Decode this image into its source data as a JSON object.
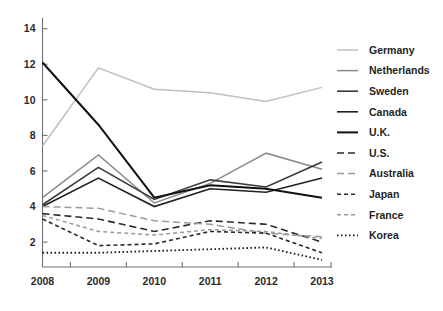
{
  "chart_data": {
    "type": "line",
    "title": "",
    "subtitle": "",
    "xlabel": "",
    "ylabel": "",
    "x": [
      "2008",
      "2009",
      "2010",
      "2011",
      "2012",
      "2013"
    ],
    "categories": [
      "2008",
      "2009",
      "2010",
      "2011",
      "2012",
      "2013"
    ],
    "xtick_labels": [
      "2008",
      "2009",
      "2010",
      "2011",
      "2012",
      "2013"
    ],
    "ytick_labels": [
      "2",
      "4",
      "6",
      "8",
      "10",
      "12",
      "14"
    ],
    "ytick_values": [
      2,
      4,
      6,
      8,
      10,
      12,
      14
    ],
    "ylim": [
      0.6,
      14.6
    ],
    "grid": false,
    "legend_position": "right",
    "series": [
      {
        "name": "Germany",
        "values": [
          7.4,
          11.8,
          10.6,
          10.4,
          9.9,
          10.7
        ],
        "color": "#bfbfbf",
        "style": "solid",
        "width": 1.5,
        "dash": ""
      },
      {
        "name": "Netherlands",
        "values": [
          4.5,
          6.9,
          4.2,
          5.3,
          7.0,
          6.1
        ],
        "color": "#8a8a8a",
        "style": "solid",
        "width": 1.5,
        "dash": ""
      },
      {
        "name": "Sweden",
        "values": [
          4.1,
          6.2,
          4.4,
          5.5,
          5.1,
          6.5
        ],
        "color": "#3a3a3a",
        "style": "solid",
        "width": 1.6,
        "dash": ""
      },
      {
        "name": "Canada",
        "values": [
          4.0,
          5.6,
          4.0,
          5.0,
          4.8,
          5.6
        ],
        "color": "#202020",
        "style": "solid",
        "width": 1.6,
        "dash": ""
      },
      {
        "name": "U.K.",
        "values": [
          12.1,
          8.6,
          4.5,
          5.2,
          5.0,
          4.5
        ],
        "color": "#111111",
        "style": "solid",
        "width": 2.0,
        "dash": ""
      },
      {
        "name": "U.S.",
        "values": [
          3.6,
          3.3,
          2.6,
          3.2,
          3.0,
          2.0
        ],
        "color": "#2a2a2a",
        "style": "dashed",
        "width": 1.6,
        "dash": "7,4"
      },
      {
        "name": "Australia",
        "values": [
          4.0,
          3.9,
          3.2,
          3.0,
          2.5,
          2.3
        ],
        "color": "#9a9a9a",
        "style": "dashed",
        "width": 1.5,
        "dash": "7,4"
      },
      {
        "name": "Japan",
        "values": [
          3.3,
          1.8,
          1.9,
          2.6,
          2.5,
          1.4
        ],
        "color": "#2a2a2a",
        "style": "dashed-short",
        "width": 1.6,
        "dash": "4,3"
      },
      {
        "name": "France",
        "values": [
          3.5,
          2.6,
          2.4,
          2.7,
          2.6,
          2.2
        ],
        "color": "#9a9a9a",
        "style": "dashed-short",
        "width": 1.5,
        "dash": "4,3"
      },
      {
        "name": "Korea",
        "values": [
          1.4,
          1.4,
          1.5,
          1.6,
          1.7,
          1.0
        ],
        "color": "#1c1c1c",
        "style": "dotted",
        "width": 1.8,
        "dash": "1.6,2.4"
      }
    ]
  },
  "legend": {
    "items": [
      {
        "label": "Germany"
      },
      {
        "label": "Netherlands"
      },
      {
        "label": "Sweden"
      },
      {
        "label": "Canada"
      },
      {
        "label": "U.K."
      },
      {
        "label": "U.S."
      },
      {
        "label": "Australia"
      },
      {
        "label": "Japan"
      },
      {
        "label": "France"
      },
      {
        "label": "Korea"
      }
    ]
  },
  "axes": {
    "y_ticks": [
      "2",
      "4",
      "6",
      "8",
      "10",
      "14",
      "12"
    ],
    "x_ticks": [
      "2008",
      "2009",
      "2010",
      "2011",
      "2012",
      "2013"
    ]
  }
}
